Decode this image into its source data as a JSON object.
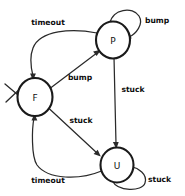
{
  "diagram": {
    "type": "state-transition-diagram",
    "states": [
      {
        "id": "F",
        "label": "F",
        "cx": 35,
        "cy": 97,
        "r": 17,
        "initial": true
      },
      {
        "id": "P",
        "label": "P",
        "cx": 113,
        "cy": 40,
        "r": 17,
        "initial": false
      },
      {
        "id": "U",
        "label": "U",
        "cx": 117,
        "cy": 165,
        "r": 16,
        "initial": false
      }
    ],
    "transitions": [
      {
        "from": "P",
        "to": "F",
        "label": "timeout",
        "label_x": 48,
        "label_y": 22,
        "kind": "curve"
      },
      {
        "from": "P",
        "to": "P",
        "label": "bump",
        "label_x": 157,
        "label_y": 20,
        "kind": "self"
      },
      {
        "from": "F",
        "to": "P",
        "label": "bump",
        "label_x": 80,
        "label_y": 77,
        "kind": "straight"
      },
      {
        "from": "P",
        "to": "U",
        "label": "stuck",
        "label_x": 133,
        "label_y": 89,
        "kind": "straight"
      },
      {
        "from": "F",
        "to": "U",
        "label": "stuck",
        "label_x": 81,
        "label_y": 120,
        "kind": "straight"
      },
      {
        "from": "U",
        "to": "F",
        "label": "timeout",
        "label_x": 48,
        "label_y": 180,
        "kind": "curve"
      },
      {
        "from": "U",
        "to": "U",
        "label": "stuck",
        "label_x": 160,
        "label_y": 179,
        "kind": "self"
      }
    ]
  }
}
